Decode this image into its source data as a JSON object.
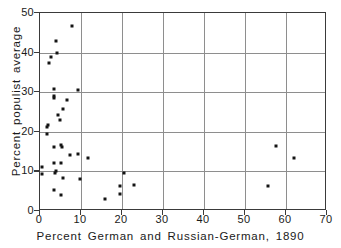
{
  "chart_data": {
    "type": "scatter",
    "title": "",
    "xlabel": "Percent German and Russian-German, 1890",
    "ylabel": "Percent populist average",
    "xlim": [
      0,
      70
    ],
    "ylim": [
      0,
      50
    ],
    "xticks": [
      0,
      10,
      20,
      30,
      40,
      50,
      60,
      70
    ],
    "yticks": [
      0,
      10,
      20,
      30,
      40,
      50
    ],
    "xticklabels": [
      "0",
      "10",
      "20",
      "30",
      "40",
      "50",
      "60",
      "70"
    ],
    "yticklabels": [
      "0",
      "10",
      "20",
      "30",
      "40",
      "50"
    ],
    "grid": true,
    "grid_color": "#8e8e8e",
    "legend": null,
    "marker_color": "#141414",
    "axis_color": "#3a3a3a",
    "background": "#ffffff",
    "points": [
      {
        "x": 7.8,
        "y": 46.8
      },
      {
        "x": 4.0,
        "y": 43.0
      },
      {
        "x": 4.1,
        "y": 40.0
      },
      {
        "x": 2.8,
        "y": 39.0
      },
      {
        "x": 2.2,
        "y": 37.3
      },
      {
        "x": 9.2,
        "y": 30.6
      },
      {
        "x": 3.5,
        "y": 30.9
      },
      {
        "x": 3.3,
        "y": 29.1
      },
      {
        "x": 3.4,
        "y": 28.5
      },
      {
        "x": 6.6,
        "y": 28.0
      },
      {
        "x": 5.6,
        "y": 25.8
      },
      {
        "x": 4.4,
        "y": 24.2
      },
      {
        "x": 4.8,
        "y": 23.0
      },
      {
        "x": 1.9,
        "y": 21.8
      },
      {
        "x": 1.8,
        "y": 21.3
      },
      {
        "x": 1.6,
        "y": 19.4
      },
      {
        "x": 5.1,
        "y": 16.6
      },
      {
        "x": 5.3,
        "y": 16.2
      },
      {
        "x": 3.4,
        "y": 16.1
      },
      {
        "x": 57.5,
        "y": 16.4
      },
      {
        "x": 7.2,
        "y": 14.2
      },
      {
        "x": 9.2,
        "y": 14.3
      },
      {
        "x": 11.8,
        "y": 13.4
      },
      {
        "x": 62.0,
        "y": 13.5
      },
      {
        "x": 3.4,
        "y": 12.2
      },
      {
        "x": 5.2,
        "y": 12.1
      },
      {
        "x": 0.5,
        "y": 11.0
      },
      {
        "x": 3.9,
        "y": 10.2
      },
      {
        "x": 3.7,
        "y": 9.7
      },
      {
        "x": 0.4,
        "y": 9.3
      },
      {
        "x": 20.6,
        "y": 9.5
      },
      {
        "x": 5.6,
        "y": 8.3
      },
      {
        "x": 9.8,
        "y": 8.2
      },
      {
        "x": 19.6,
        "y": 6.3
      },
      {
        "x": 22.9,
        "y": 6.5
      },
      {
        "x": 55.5,
        "y": 6.4
      },
      {
        "x": 3.4,
        "y": 5.4
      },
      {
        "x": 5.1,
        "y": 4.1
      },
      {
        "x": 19.6,
        "y": 4.2
      },
      {
        "x": 15.8,
        "y": 3.1
      }
    ]
  }
}
